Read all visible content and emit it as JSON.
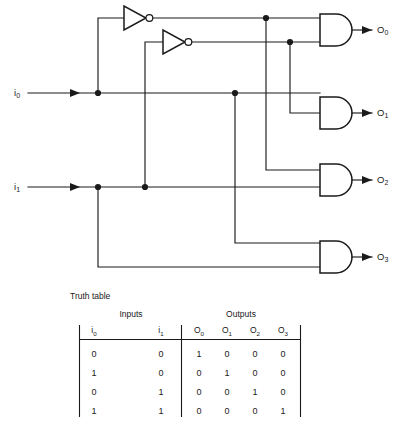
{
  "figure": {
    "line_color": "#1a1a1a",
    "background": "#ffffff"
  },
  "circuit": {
    "inputs": [
      {
        "id": "i0",
        "label": "i",
        "subscript": "0"
      },
      {
        "id": "i1",
        "label": "i",
        "subscript": "1"
      }
    ],
    "outputs": [
      {
        "id": "O0",
        "label": "O",
        "subscript": "0"
      },
      {
        "id": "O1",
        "label": "O",
        "subscript": "1"
      },
      {
        "id": "O2",
        "label": "O",
        "subscript": "2"
      },
      {
        "id": "O3",
        "label": "O",
        "subscript": "3"
      }
    ],
    "gates": [
      {
        "id": "inv0",
        "type": "NOT",
        "inputs": [
          "i0"
        ],
        "output": "not-i0"
      },
      {
        "id": "inv1",
        "type": "NOT",
        "inputs": [
          "i1"
        ],
        "output": "not-i1"
      },
      {
        "id": "and0",
        "type": "AND",
        "inputs": [
          "not-i0",
          "not-i1"
        ],
        "output": "O0"
      },
      {
        "id": "and1",
        "type": "AND",
        "inputs": [
          "i0",
          "not-i1"
        ],
        "output": "O1"
      },
      {
        "id": "and2",
        "type": "AND",
        "inputs": [
          "not-i0",
          "i1"
        ],
        "output": "O2"
      },
      {
        "id": "and3",
        "type": "AND",
        "inputs": [
          "i0",
          "i1"
        ],
        "output": "O3"
      }
    ]
  },
  "truth_table": {
    "caption": "Truth table",
    "group_headers": [
      {
        "label": "Inputs",
        "span": 2
      },
      {
        "label": "Outputs",
        "span": 4
      }
    ],
    "columns": [
      {
        "label": "i",
        "subscript": "0",
        "group": "Inputs"
      },
      {
        "label": "i",
        "subscript": "1",
        "group": "Inputs"
      },
      {
        "label": "O",
        "subscript": "0",
        "group": "Outputs"
      },
      {
        "label": "O",
        "subscript": "1",
        "group": "Outputs"
      },
      {
        "label": "O",
        "subscript": "2",
        "group": "Outputs"
      },
      {
        "label": "O",
        "subscript": "3",
        "group": "Outputs"
      }
    ],
    "rows": [
      [
        "0",
        "0",
        "1",
        "0",
        "0",
        "0"
      ],
      [
        "1",
        "0",
        "0",
        "1",
        "0",
        "0"
      ],
      [
        "0",
        "1",
        "0",
        "0",
        "1",
        "0"
      ],
      [
        "1",
        "1",
        "0",
        "0",
        "0",
        "1"
      ]
    ]
  }
}
